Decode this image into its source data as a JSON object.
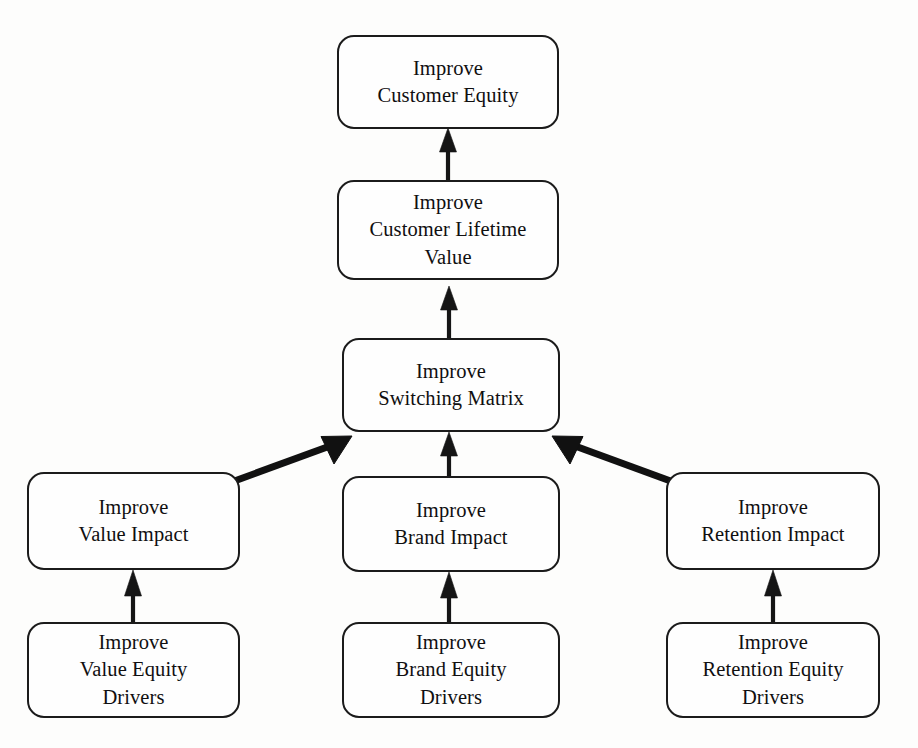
{
  "diagram": {
    "background_color": "#fdfdfc",
    "line_color": "#1b1b1b",
    "text_color": "#100f10",
    "nodes": [
      {
        "id": "customer-equity",
        "label": "Improve\nCustomer Equity",
        "lines": [
          "Improve",
          "Customer Equity"
        ],
        "level": 1,
        "x": 337,
        "y": 35,
        "w": 222,
        "h": 94
      },
      {
        "id": "customer-lifetime-value",
        "label": "Improve\nCustomer Lifetime\nValue",
        "lines": [
          "Improve",
          "Customer Lifetime",
          "Value"
        ],
        "level": 2,
        "x": 337,
        "y": 180,
        "w": 222,
        "h": 100
      },
      {
        "id": "switching-matrix",
        "label": "Improve\nSwitching Matrix",
        "lines": [
          "Improve",
          "Switching Matrix"
        ],
        "level": 3,
        "x": 342,
        "y": 338,
        "w": 218,
        "h": 94
      },
      {
        "id": "value-impact",
        "label": "Improve\nValue Impact",
        "lines": [
          "Improve",
          "Value Impact"
        ],
        "level": 4,
        "x": 27,
        "y": 472,
        "w": 213,
        "h": 98
      },
      {
        "id": "brand-impact",
        "label": "Improve\nBrand Impact",
        "lines": [
          "Improve",
          "Brand Impact"
        ],
        "level": 4,
        "x": 342,
        "y": 476,
        "w": 218,
        "h": 96
      },
      {
        "id": "retention-impact",
        "label": "Improve\nRetention Impact",
        "lines": [
          "Improve",
          "Retention Impact"
        ],
        "level": 4,
        "x": 666,
        "y": 472,
        "w": 214,
        "h": 98
      },
      {
        "id": "value-equity-drivers",
        "label": "Improve\nValue Equity\nDrivers",
        "lines": [
          "Improve",
          "Value Equity",
          "Drivers"
        ],
        "level": 5,
        "x": 27,
        "y": 622,
        "w": 213,
        "h": 96
      },
      {
        "id": "brand-equity-drivers",
        "label": "Improve\nBrand Equity\nDrivers",
        "lines": [
          "Improve",
          "Brand Equity",
          "Drivers"
        ],
        "level": 5,
        "x": 342,
        "y": 622,
        "w": 218,
        "h": 96
      },
      {
        "id": "retention-equity-drivers",
        "label": "Improve\nRetention Equity\nDrivers",
        "lines": [
          "Improve",
          "Retention Equity",
          "Drivers"
        ],
        "level": 5,
        "x": 666,
        "y": 622,
        "w": 214,
        "h": 96
      }
    ],
    "edges": [
      {
        "from": "customer-lifetime-value",
        "to": "customer-equity",
        "style": "vertical-arrow"
      },
      {
        "from": "switching-matrix",
        "to": "customer-lifetime-value",
        "style": "vertical-arrow"
      },
      {
        "from": "value-impact",
        "to": "switching-matrix",
        "style": "diagonal-arrow"
      },
      {
        "from": "brand-impact",
        "to": "switching-matrix",
        "style": "vertical-arrow"
      },
      {
        "from": "retention-impact",
        "to": "switching-matrix",
        "style": "diagonal-arrow"
      },
      {
        "from": "value-equity-drivers",
        "to": "value-impact",
        "style": "vertical-arrow"
      },
      {
        "from": "brand-equity-drivers",
        "to": "brand-impact",
        "style": "vertical-arrow"
      },
      {
        "from": "retention-equity-drivers",
        "to": "retention-impact",
        "style": "vertical-arrow"
      }
    ]
  }
}
